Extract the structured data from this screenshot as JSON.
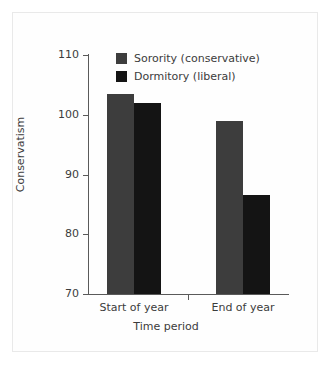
{
  "chart_data": {
    "type": "bar",
    "title": "",
    "xlabel": "Time period",
    "ylabel": "Conservatism",
    "categories": [
      "Start of year",
      "End of year"
    ],
    "series": [
      {
        "name": "Sorority (conservative)",
        "values": [
          103.5,
          99.0
        ],
        "color": "#3d3d3d"
      },
      {
        "name": "Dormitory (liberal)",
        "values": [
          102.0,
          86.5
        ],
        "color": "#141414"
      }
    ],
    "ylim": [
      70,
      110
    ],
    "yticks": [
      70,
      80,
      90,
      100,
      110
    ],
    "ytick_labels": [
      "70",
      "80",
      "90",
      "100",
      "110"
    ],
    "grid": false,
    "legend_position": "top-center",
    "bar_group_layout": "grouped"
  },
  "axes": {
    "ylabel": "Conservatism",
    "xlabel": "Time period",
    "ytick_labels": [
      "110",
      "100",
      "90",
      "80",
      "70"
    ],
    "xtick_labels": [
      "Start of year",
      "End of year"
    ]
  },
  "legend": {
    "items": [
      {
        "label": "Sorority (conservative)",
        "color": "#3d3d3d"
      },
      {
        "label": "Dormitory (liberal)",
        "color": "#141414"
      }
    ]
  },
  "colors": {
    "sorority": "#3d3d3d",
    "dormitory": "#141414",
    "axis": "#5a5a5a",
    "text": "#3c3c3c",
    "frame": "#e9e9e9",
    "background": "#ffffff"
  }
}
